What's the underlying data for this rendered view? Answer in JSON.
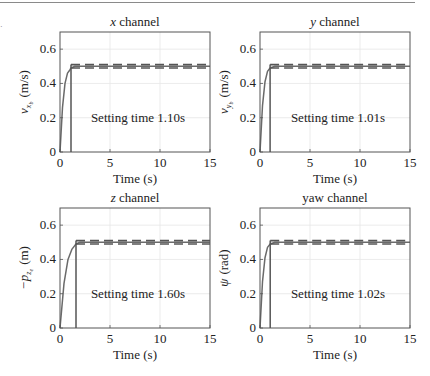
{
  "figure": {
    "panels": [
      {
        "title_italic": "x",
        "title_rest": " channel",
        "ylabel_main": "v",
        "ylabel_sub": "x",
        "ylabel_subsub": "b",
        "ylabel_unit": "(m/s)",
        "annotation": "Setting time 1.10s",
        "xlabel": "Time (s)"
      },
      {
        "title_italic": "y",
        "title_rest": " channel",
        "ylabel_main": "v",
        "ylabel_sub": "y",
        "ylabel_subsub": "b",
        "ylabel_unit": "(m/s)",
        "annotation": "Setting time 1.01s",
        "xlabel": "Time (s)"
      },
      {
        "title_italic": "z",
        "title_rest": " channel",
        "ylabel_main": "−p",
        "ylabel_sub": "z",
        "ylabel_subsub": "e",
        "ylabel_unit": "(m)",
        "annotation": "Setting time 1.60s",
        "xlabel": "Time (s)"
      },
      {
        "title_italic": "",
        "title_rest": "yaw channel",
        "ylabel_main": "ψ",
        "ylabel_sub": "",
        "ylabel_subsub": "",
        "ylabel_unit": "(rad)",
        "annotation": "Setting time 1.02s",
        "xlabel": "Time (s)"
      }
    ],
    "xticks": [
      "0",
      "5",
      "10",
      "15"
    ],
    "yticks": [
      "0",
      "0.2",
      "0.4",
      "0.6"
    ]
  },
  "chart_data": [
    {
      "type": "line",
      "title": "x channel",
      "xlabel": "Time (s)",
      "ylabel": "v_{x_b} (m/s)",
      "xlim": [
        0,
        15
      ],
      "ylim": [
        0,
        0.7
      ],
      "xticks": [
        0,
        5,
        10,
        15
      ],
      "yticks": [
        0,
        0.2,
        0.4,
        0.6
      ],
      "grid": true,
      "series": [
        {
          "name": "response",
          "style": "solid",
          "x": [
            0,
            0.25,
            0.5,
            0.75,
            1.0,
            1.1,
            1.5,
            2,
            15
          ],
          "y": [
            0,
            0.26,
            0.4,
            0.46,
            0.48,
            0.49,
            0.5,
            0.5,
            0.5
          ]
        },
        {
          "name": "upper bound (+2%)",
          "style": "dashed",
          "x": [
            1.1,
            15
          ],
          "y": [
            0.51,
            0.51
          ]
        },
        {
          "name": "lower bound (-2%)",
          "style": "dashed",
          "x": [
            1.1,
            15
          ],
          "y": [
            0.49,
            0.49
          ]
        },
        {
          "name": "settling marker",
          "style": "solid",
          "x": [
            1.1,
            1.1
          ],
          "y": [
            0,
            0.51
          ]
        }
      ],
      "annotations": [
        "Setting time 1.10s"
      ],
      "settling_time": 1.1
    },
    {
      "type": "line",
      "title": "y channel",
      "xlabel": "Time (s)",
      "ylabel": "v_{y_b} (m/s)",
      "xlim": [
        0,
        15
      ],
      "ylim": [
        0,
        0.7
      ],
      "xticks": [
        0,
        5,
        10,
        15
      ],
      "yticks": [
        0,
        0.2,
        0.4,
        0.6
      ],
      "grid": true,
      "series": [
        {
          "name": "response",
          "style": "solid",
          "x": [
            0,
            0.25,
            0.5,
            0.75,
            1.01,
            1.5,
            2,
            15
          ],
          "y": [
            0,
            0.27,
            0.41,
            0.47,
            0.49,
            0.5,
            0.5,
            0.5
          ]
        },
        {
          "name": "upper bound (+2%)",
          "style": "dashed",
          "x": [
            1.01,
            15
          ],
          "y": [
            0.51,
            0.51
          ]
        },
        {
          "name": "lower bound (-2%)",
          "style": "dashed",
          "x": [
            1.01,
            15
          ],
          "y": [
            0.49,
            0.49
          ]
        },
        {
          "name": "settling marker",
          "style": "solid",
          "x": [
            1.01,
            1.01
          ],
          "y": [
            0,
            0.51
          ]
        }
      ],
      "annotations": [
        "Setting time 1.01s"
      ],
      "settling_time": 1.01
    },
    {
      "type": "line",
      "title": "z channel",
      "xlabel": "Time (s)",
      "ylabel": "-p_{z_e} (m)",
      "xlim": [
        0,
        15
      ],
      "ylim": [
        0,
        0.7
      ],
      "xticks": [
        0,
        5,
        10,
        15
      ],
      "yticks": [
        0,
        0.2,
        0.4,
        0.6
      ],
      "grid": true,
      "series": [
        {
          "name": "response",
          "style": "solid",
          "x": [
            0,
            0.4,
            0.8,
            1.2,
            1.6,
            2,
            15
          ],
          "y": [
            0,
            0.26,
            0.4,
            0.46,
            0.49,
            0.5,
            0.5
          ]
        },
        {
          "name": "upper bound (+2%)",
          "style": "dashed",
          "x": [
            1.6,
            15
          ],
          "y": [
            0.51,
            0.51
          ]
        },
        {
          "name": "lower bound (-2%)",
          "style": "dashed",
          "x": [
            1.6,
            15
          ],
          "y": [
            0.49,
            0.49
          ]
        },
        {
          "name": "settling marker",
          "style": "solid",
          "x": [
            1.6,
            1.6
          ],
          "y": [
            0,
            0.51
          ]
        }
      ],
      "annotations": [
        "Setting time 1.60s"
      ],
      "settling_time": 1.6
    },
    {
      "type": "line",
      "title": "yaw channel",
      "xlabel": "Time (s)",
      "ylabel": "ψ (rad)",
      "xlim": [
        0,
        15
      ],
      "ylim": [
        0,
        0.7
      ],
      "xticks": [
        0,
        5,
        10,
        15
      ],
      "yticks": [
        0,
        0.2,
        0.4,
        0.6
      ],
      "grid": true,
      "series": [
        {
          "name": "response",
          "style": "solid",
          "x": [
            0,
            0.25,
            0.5,
            0.75,
            1.02,
            1.5,
            2,
            15
          ],
          "y": [
            0,
            0.27,
            0.41,
            0.47,
            0.49,
            0.5,
            0.5,
            0.5
          ]
        },
        {
          "name": "upper bound (+2%)",
          "style": "dashed",
          "x": [
            1.02,
            15
          ],
          "y": [
            0.51,
            0.51
          ]
        },
        {
          "name": "lower bound (-2%)",
          "style": "dashed",
          "x": [
            1.02,
            15
          ],
          "y": [
            0.49,
            0.49
          ]
        },
        {
          "name": "settling marker",
          "style": "solid",
          "x": [
            1.02,
            1.02
          ],
          "y": [
            0,
            0.51
          ]
        }
      ],
      "annotations": [
        "Setting time 1.02s"
      ],
      "settling_time": 1.02
    }
  ]
}
